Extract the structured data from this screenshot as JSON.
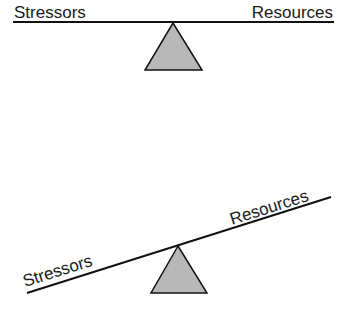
{
  "diagram": {
    "type": "balance-scale",
    "colors": {
      "line": "#111111",
      "fulcrum_fill": "#b8b8b8",
      "fulcrum_stroke": "#111111",
      "text": "#1a1a1a",
      "background": "#ffffff"
    },
    "balanced": {
      "left_label": "Stressors",
      "right_label": "Resources",
      "state": "balanced"
    },
    "tilted": {
      "left_label": "Stressors",
      "right_label": "Resources",
      "state": "resources heavier side up / stressors side down"
    }
  }
}
